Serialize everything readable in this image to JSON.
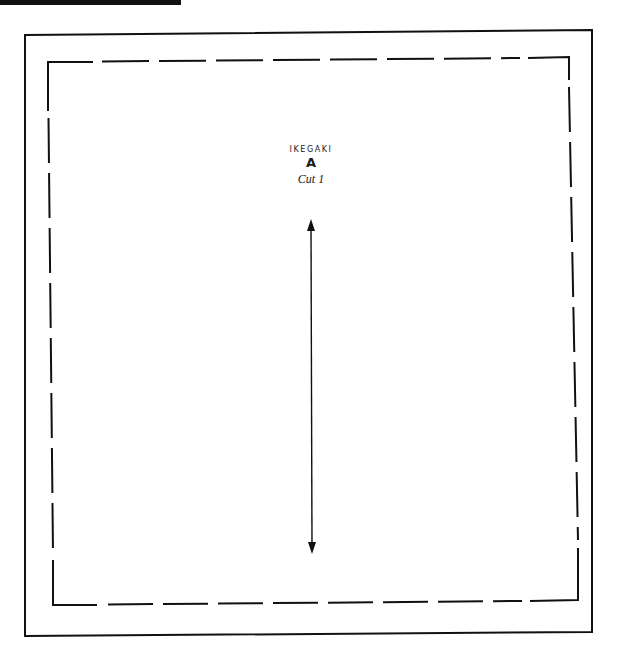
{
  "pattern_piece": {
    "name": "IKEGAKI",
    "letter": "A",
    "cut_instruction": "Cut 1"
  },
  "icons": {
    "grainline": "double-headed-arrow-icon"
  },
  "colors": {
    "line": "#111111",
    "background": "#ffffff"
  }
}
